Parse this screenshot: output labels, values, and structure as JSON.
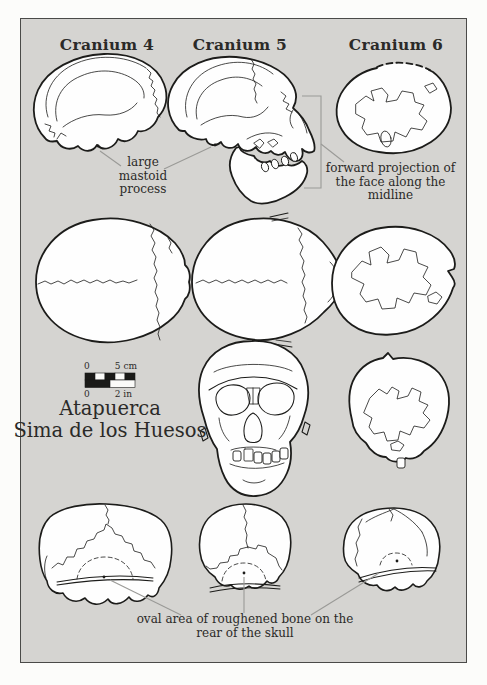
{
  "figure": {
    "columns": [
      {
        "label": "Cranium 4"
      },
      {
        "label": "Cranium 5"
      },
      {
        "label": "Cranium 6"
      }
    ],
    "site_title": {
      "lines": [
        "Atapuerca",
        "Sima de los Huesos"
      ]
    },
    "annotations": {
      "mastoid": {
        "lines": [
          "large",
          "mastoid",
          "process"
        ]
      },
      "forward_projection": {
        "lines": [
          "forward projection of",
          "the face along the",
          "midline"
        ]
      },
      "oval_area": {
        "lines": [
          "oval area of roughened bone on the",
          "rear of the skull"
        ]
      }
    },
    "scale_bar": {
      "cm_zero": "0",
      "cm_label": "5 cm",
      "in_zero": "0",
      "in_label": "2 in"
    },
    "colors": {
      "page_background": "#fcfcfa",
      "panel_background": "#d5d4d1",
      "panel_border": "#4a4a48",
      "skull_outline": "#1c1c1a",
      "skull_fill": "#fefefe",
      "leader_line": "#9a9a97",
      "text": "#2b2a28"
    }
  }
}
